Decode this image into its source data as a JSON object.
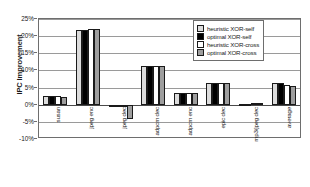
{
  "chart_data": {
    "type": "bar",
    "title": "",
    "xlabel": "",
    "ylabel": "IPC Improvement",
    "ylim": [
      -10,
      25
    ],
    "ytick_step": 5,
    "grid": true,
    "legend_position": "top-right",
    "ytick_labels": [
      "25%",
      "20%",
      "15%",
      "10%",
      "5%",
      "0%",
      "-5%",
      "-10%"
    ],
    "ytick_values": [
      25,
      20,
      15,
      10,
      5,
      0,
      -5,
      -10
    ],
    "categories": [
      "susan",
      "jpeg enc",
      "jpeg dec",
      "adpcm dec",
      "adpcm enc",
      "epic dec",
      "mp3/jpeg dec",
      "average"
    ],
    "series": [
      {
        "name": "heuristic XOR-self",
        "color": "#dcdcdc",
        "values": [
          2.4,
          21.7,
          -0.2,
          11.4,
          3.4,
          6.2,
          0.2,
          6.3
        ]
      },
      {
        "name": "optimal XOR-self",
        "color": "#000000",
        "values": [
          2.4,
          21.7,
          -0.2,
          11.4,
          3.4,
          6.3,
          0.3,
          6.3
        ]
      },
      {
        "name": "heuristic XOR-cross",
        "color": "#ffffff",
        "values": [
          2.4,
          22.0,
          -0.3,
          11.4,
          3.4,
          6.4,
          0.5,
          5.7
        ]
      },
      {
        "name": "optimal XOR-cross",
        "color": "#9e9e9e",
        "values": [
          2.3,
          22.0,
          -4.3,
          11.3,
          3.4,
          6.3,
          0.4,
          5.6
        ]
      }
    ]
  }
}
